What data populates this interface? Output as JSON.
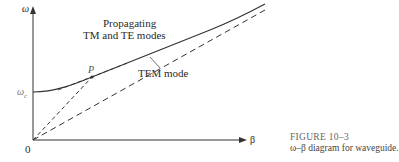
{
  "diagram": {
    "y_axis_label": "ω",
    "x_axis_label": "β",
    "origin_label": "0",
    "cutoff_label": "ω",
    "cutoff_subscript": "c",
    "point_label": "P",
    "curve_label_line1": "Propagating",
    "curve_label_line2": "TM and TE modes",
    "tem_label": "TEM mode"
  },
  "caption": {
    "figure_number": "FIGURE 10–3",
    "text": "ω–β diagram for waveguide."
  },
  "colors": {
    "ink": "#333333",
    "caption_number": "#666666"
  }
}
